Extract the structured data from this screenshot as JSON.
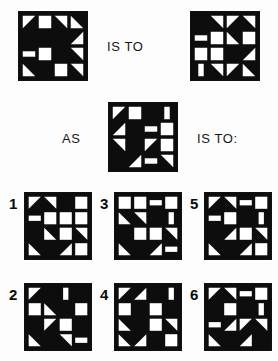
{
  "page": {
    "kind": "visual-analogy-puzzle",
    "background_color": "#fdfdfd",
    "ink_color": "#0d0d0d",
    "paper_color": "#ffffff",
    "width": 278,
    "height": 361
  },
  "relations": {
    "is_to_top": "IS TO",
    "as": "AS",
    "is_to_question": "IS TO:"
  },
  "prompt": {
    "a_label": "A",
    "b_label": "B",
    "c_label": "C",
    "a": {
      "name": "prompt-square-a",
      "x": 18,
      "y": 11,
      "size": 70,
      "cells": [
        [
          "tri-tl-w",
          "solid-w",
          "tri-tr-w",
          "tri-bl-w"
        ],
        [
          "solid-k",
          "rect-w",
          "solid-k",
          "tri-br-w"
        ],
        [
          "bar-w",
          "solid-w",
          "solid-k",
          "tri-tr-w"
        ],
        [
          "tri-bl-w",
          "solid-k",
          "solid-w",
          "tri-tr-w"
        ]
      ]
    },
    "b": {
      "name": "prompt-square-b",
      "x": 190,
      "y": 11,
      "size": 70,
      "cells": [
        [
          "solid-k",
          "tri-tr-w",
          "tri-tl-w",
          "tri-tr-w"
        ],
        [
          "bar-w",
          "solid-w",
          "tri-bl-w",
          "solid-w"
        ],
        [
          "solid-w",
          "solid-w",
          "solid-k",
          "tri-br-w"
        ],
        [
          "bar-v-w",
          "tri-tr-w",
          "tri-tl-w",
          "tri-bl-w"
        ]
      ]
    },
    "c": {
      "name": "prompt-square-c",
      "x": 108,
      "y": 102,
      "size": 70,
      "cells": [
        [
          "tri-tl-w",
          "solid-w",
          "solid-k",
          "bar-v-w"
        ],
        [
          "tri-br-w",
          "solid-k",
          "bar-w",
          "solid-w"
        ],
        [
          "tri-tr-w",
          "solid-k",
          "tri-tl-w",
          "solid-w"
        ],
        [
          "solid-k",
          "tri-br-w",
          "bar-w",
          "tri-tr-w"
        ]
      ]
    }
  },
  "options": [
    {
      "label": "1",
      "name": "option-1",
      "label_x": 9,
      "label_y": 196,
      "x": 24,
      "y": 192,
      "size": 68,
      "cells": [
        [
          "tri-tl-w",
          "tri-tr-w",
          "solid-k",
          "solid-w"
        ],
        [
          "bar-w",
          "solid-w",
          "solid-w",
          "solid-w"
        ],
        [
          "solid-k",
          "tri-bl-w",
          "solid-w",
          "tri-tr-w"
        ],
        [
          "tri-bl-w",
          "solid-k",
          "tri-br-w",
          "solid-w"
        ]
      ]
    },
    {
      "label": "3",
      "name": "option-3",
      "label_x": 100,
      "label_y": 196,
      "x": 114,
      "y": 192,
      "size": 68,
      "cells": [
        [
          "solid-w",
          "solid-w",
          "bar-w",
          "solid-w"
        ],
        [
          "tri-bl-w",
          "tri-tr-w",
          "solid-k",
          "bar-v-w"
        ],
        [
          "solid-k",
          "solid-w",
          "solid-w",
          "tri-tr-w"
        ],
        [
          "tri-bl-w",
          "solid-k",
          "tri-br-w",
          "bar-w"
        ]
      ]
    },
    {
      "label": "5",
      "name": "option-5",
      "label_x": 190,
      "label_y": 196,
      "x": 204,
      "y": 192,
      "size": 68,
      "cells": [
        [
          "tri-tl-w",
          "tri-tr-w",
          "bar-w",
          "solid-w"
        ],
        [
          "bar-w",
          "solid-w",
          "solid-k",
          "bar-v-w"
        ],
        [
          "solid-k",
          "tri-br-w",
          "solid-w",
          "tri-tr-w"
        ],
        [
          "tri-bl-w",
          "solid-k",
          "tri-br-w",
          "solid-w"
        ]
      ]
    },
    {
      "label": "2",
      "name": "option-2",
      "label_x": 9,
      "label_y": 287,
      "x": 24,
      "y": 283,
      "size": 68,
      "cells": [
        [
          "tri-tl-w",
          "solid-k",
          "bar-v-w",
          "solid-k"
        ],
        [
          "solid-w",
          "tri-bl-w",
          "solid-k",
          "solid-w"
        ],
        [
          "solid-k",
          "tri-tl-w",
          "solid-w",
          "solid-k"
        ],
        [
          "tri-bl-w",
          "solid-k",
          "tri-tr-w",
          "bar-w"
        ]
      ]
    },
    {
      "label": "4",
      "name": "option-4",
      "label_x": 100,
      "label_y": 287,
      "x": 114,
      "y": 283,
      "size": 68,
      "cells": [
        [
          "tri-tl-w",
          "tri-br-w",
          "solid-k",
          "bar-v-w"
        ],
        [
          "solid-w",
          "solid-k",
          "solid-w",
          "solid-k"
        ],
        [
          "tri-bl-w",
          "solid-k",
          "solid-w",
          "tri-tr-w"
        ],
        [
          "tri-bl-w",
          "tri-br-w",
          "solid-k",
          "solid-w"
        ]
      ]
    },
    {
      "label": "6",
      "name": "option-6",
      "label_x": 190,
      "label_y": 287,
      "x": 204,
      "y": 283,
      "size": 68,
      "cells": [
        [
          "tri-tl-w",
          "tri-tr-w",
          "bar-w",
          "solid-w"
        ],
        [
          "solid-k",
          "solid-w",
          "solid-k",
          "bar-v-w"
        ],
        [
          "bar-w",
          "tri-br-w",
          "tri-tl-w",
          "tri-tr-w"
        ],
        [
          "tri-bl-w",
          "solid-k",
          "tri-br-w",
          "solid-k"
        ]
      ]
    }
  ],
  "text_positions": {
    "is_to_top": {
      "x": 107,
      "y": 39
    },
    "as": {
      "x": 62,
      "y": 131
    },
    "is_to_question": {
      "x": 197,
      "y": 131
    }
  }
}
